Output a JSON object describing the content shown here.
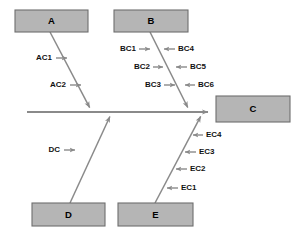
{
  "diagram": {
    "type": "fishbone-ishikawa",
    "title": "",
    "background_color": "#ffffff",
    "box_fill_color": "#b5b5b5",
    "box_stroke_color": "#6e6e6e",
    "line_color": "#8a8a8a",
    "text_color": "#111111",
    "width": 305,
    "height": 238
  },
  "spine": {
    "name": "main-spine",
    "x1": 27,
    "y1": 112,
    "x2": 214,
    "y2": 112,
    "arrow": "right"
  },
  "category_boxes": [
    {
      "id": "A",
      "label": "A",
      "x": 15,
      "y": 10,
      "width": 73,
      "height": 22,
      "position": "top-left"
    },
    {
      "id": "B",
      "label": "B",
      "x": 114,
      "y": 10,
      "width": 74,
      "height": 22,
      "position": "top-middle"
    },
    {
      "id": "C",
      "label": "C",
      "x": 216,
      "y": 96,
      "width": 74,
      "height": 26,
      "position": "effect-right"
    },
    {
      "id": "D",
      "label": "D",
      "x": 32,
      "y": 203,
      "width": 73,
      "height": 23,
      "position": "bottom-left"
    },
    {
      "id": "E",
      "label": "E",
      "x": 118,
      "y": 203,
      "width": 75,
      "height": 23,
      "position": "bottom-middle"
    }
  ],
  "bones": [
    {
      "id": "bone-A",
      "from_box": "A",
      "x1": 50,
      "y1": 32,
      "x2": 92,
      "y2": 112,
      "arrow": "end"
    },
    {
      "id": "bone-B",
      "from_box": "B",
      "x1": 150,
      "y1": 32,
      "x2": 190,
      "y2": 112,
      "arrow": "end"
    },
    {
      "id": "bone-D",
      "from_box": "D",
      "x1": 70,
      "y1": 203,
      "x2": 112,
      "y2": 112,
      "arrow": "end"
    },
    {
      "id": "bone-E",
      "from_box": "E",
      "x1": 155,
      "y1": 203,
      "x2": 203,
      "y2": 112,
      "arrow": "end"
    }
  ],
  "causes": [
    {
      "id": "AC1",
      "label": "AC1",
      "bone": "bone-A",
      "side": "left",
      "text_x": 52,
      "text_y": 58,
      "tick_x1": 56,
      "tick_x2": 72,
      "arrow_dir": "right"
    },
    {
      "id": "AC2",
      "label": "AC2",
      "bone": "bone-A",
      "side": "left",
      "text_x": 66,
      "text_y": 85,
      "tick_x1": 70,
      "tick_x2": 86,
      "arrow_dir": "right"
    },
    {
      "id": "BC1",
      "label": "BC1",
      "bone": "bone-B",
      "side": "left",
      "text_x": 136,
      "text_y": 49,
      "tick_x1": 139,
      "tick_x2": 155,
      "arrow_dir": "right"
    },
    {
      "id": "BC2",
      "label": "BC2",
      "bone": "bone-B",
      "side": "left",
      "text_x": 150,
      "text_y": 67,
      "tick_x1": 153,
      "tick_x2": 168,
      "arrow_dir": "right"
    },
    {
      "id": "BC3",
      "label": "BC3",
      "bone": "bone-B",
      "side": "left",
      "text_x": 161,
      "text_y": 85,
      "tick_x1": 164,
      "tick_x2": 180,
      "arrow_dir": "right"
    },
    {
      "id": "BC4",
      "label": "BC4",
      "bone": "bone-B",
      "side": "right",
      "text_x": 178,
      "text_y": 49,
      "tick_x1": 175,
      "tick_x2": 159,
      "arrow_dir": "left"
    },
    {
      "id": "BC5",
      "label": "BC5",
      "bone": "bone-B",
      "side": "right",
      "text_x": 190,
      "text_y": 67,
      "tick_x1": 187,
      "tick_x2": 171,
      "arrow_dir": "left"
    },
    {
      "id": "BC6",
      "label": "BC6",
      "bone": "bone-B",
      "side": "right",
      "text_x": 198,
      "text_y": 85,
      "tick_x1": 195,
      "tick_x2": 180,
      "arrow_dir": "left"
    },
    {
      "id": "DC",
      "label": "DC",
      "bone": "bone-D",
      "side": "left",
      "text_x": 60,
      "text_y": 150,
      "tick_x1": 64,
      "tick_x2": 80,
      "arrow_dir": "right"
    },
    {
      "id": "EC4",
      "label": "EC4",
      "bone": "bone-E",
      "side": "right",
      "text_x": 206,
      "text_y": 135,
      "tick_x1": 203,
      "tick_x2": 188,
      "arrow_dir": "left"
    },
    {
      "id": "EC3",
      "label": "EC3",
      "bone": "bone-E",
      "side": "right",
      "text_x": 199,
      "text_y": 152,
      "tick_x1": 196,
      "tick_x2": 180,
      "arrow_dir": "left"
    },
    {
      "id": "EC2",
      "label": "EC2",
      "bone": "bone-E",
      "side": "right",
      "text_x": 190,
      "text_y": 169,
      "tick_x1": 187,
      "tick_x2": 171,
      "arrow_dir": "left"
    },
    {
      "id": "EC1",
      "label": "EC1",
      "bone": "bone-E",
      "side": "right",
      "text_x": 181,
      "text_y": 188,
      "tick_x1": 178,
      "tick_x2": 162,
      "arrow_dir": "left"
    }
  ]
}
